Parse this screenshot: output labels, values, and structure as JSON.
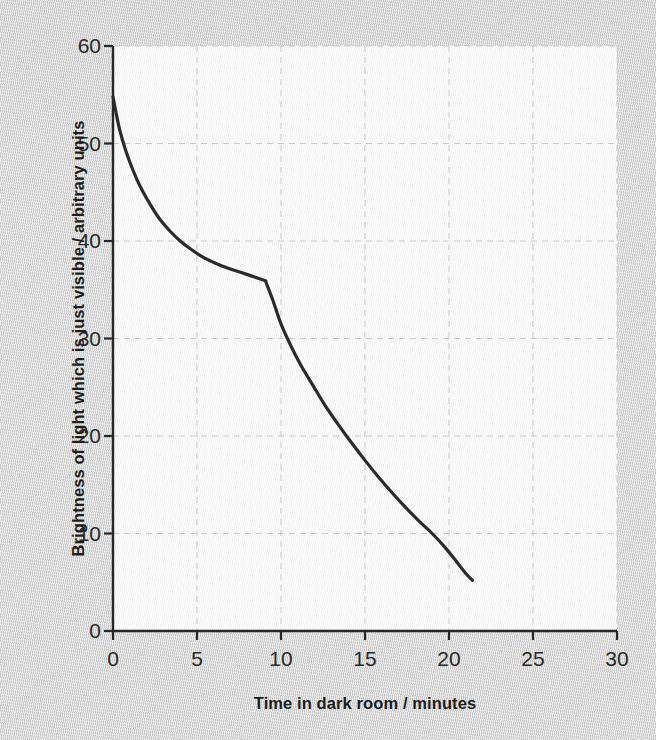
{
  "chart_data": {
    "type": "line",
    "title": "",
    "xlabel": "Time in dark room / minutes",
    "ylabel": "Brightness of light which is just visible / arbitrary units",
    "xlim": [
      0,
      30
    ],
    "ylim": [
      0,
      60
    ],
    "xticks": [
      0,
      5,
      10,
      15,
      20,
      25,
      30
    ],
    "yticks": [
      0,
      10,
      20,
      30,
      40,
      50,
      60
    ],
    "xtick_labels": [
      "0",
      "5",
      "10",
      "15",
      "20",
      "25",
      "30"
    ],
    "ytick_labels": [
      "0",
      "10",
      "20",
      "30",
      "40",
      "50",
      "60"
    ],
    "grid": "dashed-both-axes",
    "legend": "none",
    "line_color": "#2b2b2b",
    "line_width": 3.2,
    "plot_background": "#f8f8f8",
    "page_background": "#d2d2d2",
    "annotations": [
      {
        "label": "rod-cone break",
        "x": 9.1,
        "y": 35.9
      }
    ],
    "series": [
      {
        "name": "Dark adaptation curve",
        "x": [
          0.0,
          0.2,
          0.4,
          0.7,
          1.0,
          1.4,
          1.8,
          2.3,
          2.8,
          3.4,
          4.0,
          4.6,
          5.3,
          6.0,
          6.7,
          7.4,
          8.1,
          8.6,
          9.1,
          9.1,
          9.5,
          10.0,
          10.6,
          11.2,
          11.9,
          12.6,
          13.4,
          14.2,
          15.0,
          15.8,
          16.6,
          17.4,
          18.2,
          19.0,
          19.8,
          20.5,
          21.0,
          21.4
        ],
        "y": [
          54.8,
          53.0,
          51.4,
          49.6,
          48.1,
          46.4,
          45.0,
          43.5,
          42.2,
          41.0,
          40.0,
          39.2,
          38.4,
          37.8,
          37.3,
          36.9,
          36.5,
          36.2,
          35.9,
          35.8,
          34.0,
          31.5,
          29.2,
          27.2,
          25.2,
          23.2,
          21.2,
          19.3,
          17.5,
          15.8,
          14.2,
          12.7,
          11.3,
          10.0,
          8.5,
          7.0,
          5.9,
          5.2
        ]
      }
    ]
  }
}
